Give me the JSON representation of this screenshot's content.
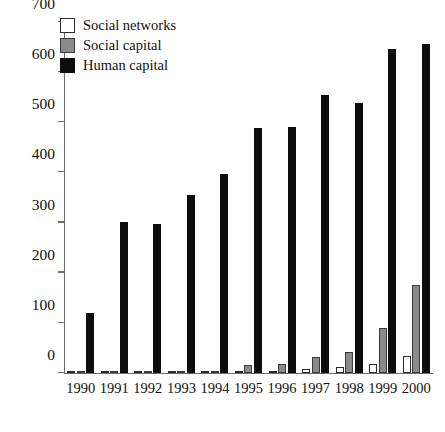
{
  "chart_data": {
    "type": "bar",
    "title": "",
    "xlabel": "",
    "ylabel": "",
    "ylim": [
      0,
      700
    ],
    "ytick_values": [
      0,
      100,
      200,
      300,
      400,
      500,
      600,
      700
    ],
    "ytick_labels": [
      "0",
      "100",
      "200",
      "300",
      "400",
      "500",
      "600",
      "700"
    ],
    "grid": false,
    "legend_position": "top-left",
    "categories": [
      "1990",
      "1991",
      "1992",
      "1993",
      "1994",
      "1995",
      "1996",
      "1997",
      "1998",
      "1999",
      "2000"
    ],
    "series": [
      {
        "name": "Social networks",
        "color": "#ffffff",
        "values": [
          1,
          1,
          1,
          2,
          3,
          4,
          5,
          8,
          12,
          17,
          33
        ]
      },
      {
        "name": "Social capital",
        "color": "#8a8a8a",
        "values": [
          1,
          1,
          2,
          4,
          5,
          15,
          17,
          31,
          42,
          89,
          176
        ]
      },
      {
        "name": "Human capital",
        "color": "#0d0d0d",
        "values": [
          120,
          302,
          297,
          355,
          396,
          488,
          491,
          554,
          538,
          646,
          656
        ]
      }
    ]
  },
  "legend": {
    "items": [
      {
        "label": "Social networks",
        "swatch": "social-networks"
      },
      {
        "label": "Social capital",
        "swatch": "social-capital"
      },
      {
        "label": "Human capital",
        "swatch": "human-capital"
      }
    ]
  }
}
